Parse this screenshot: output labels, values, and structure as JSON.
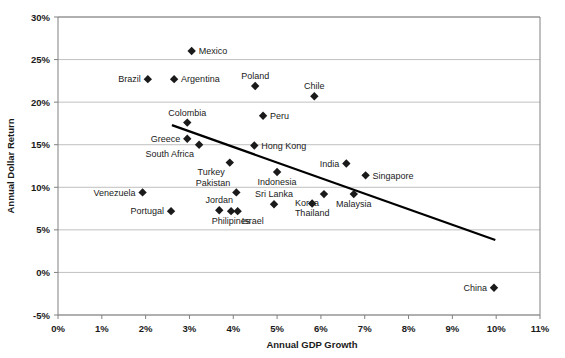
{
  "chart_data": {
    "type": "scatter",
    "title": "",
    "xlabel": "Annual GDP Growth",
    "ylabel": "Annual Dollar Return",
    "xlim": [
      0,
      11
    ],
    "ylim": [
      -5,
      30
    ],
    "xtick_labels": [
      "0%",
      "1%",
      "2%",
      "3%",
      "4%",
      "5%",
      "6%",
      "7%",
      "8%",
      "9%",
      "10%",
      "11%"
    ],
    "xticks": [
      0,
      1,
      2,
      3,
      4,
      5,
      6,
      7,
      8,
      9,
      10,
      11
    ],
    "ytick_labels": [
      "-5%",
      "0%",
      "5%",
      "10%",
      "15%",
      "20%",
      "25%",
      "30%"
    ],
    "yticks": [
      -5,
      0,
      5,
      10,
      15,
      20,
      25,
      30
    ],
    "grid": "horizontal",
    "legend": "none",
    "units": "percent",
    "marker_shape": "diamond",
    "marker_color": "#1a1a1a",
    "points": [
      {
        "name": "Mexico",
        "x": 3.05,
        "y": 26.0,
        "label_pos": "right"
      },
      {
        "name": "Brazil",
        "x": 2.05,
        "y": 22.7,
        "label_pos": "left"
      },
      {
        "name": "Argentina",
        "x": 2.65,
        "y": 22.7,
        "label_pos": "right"
      },
      {
        "name": "Poland",
        "x": 4.5,
        "y": 21.9,
        "label_pos": "above"
      },
      {
        "name": "Chile",
        "x": 5.85,
        "y": 20.7,
        "label_pos": "above"
      },
      {
        "name": "Peru",
        "x": 4.68,
        "y": 18.4,
        "label_pos": "right"
      },
      {
        "name": "Colombia",
        "x": 2.95,
        "y": 17.6,
        "label_pos": "above"
      },
      {
        "name": "Greece",
        "x": 2.95,
        "y": 15.7,
        "label_pos": "left"
      },
      {
        "name": "South Africa",
        "x": 3.22,
        "y": 15.0,
        "label_pos": "belowleft"
      },
      {
        "name": "Hong Kong",
        "x": 4.48,
        "y": 14.9,
        "label_pos": "right"
      },
      {
        "name": "Turkey",
        "x": 3.92,
        "y": 12.9,
        "label_pos": "belowleft"
      },
      {
        "name": "India",
        "x": 6.58,
        "y": 12.8,
        "label_pos": "left"
      },
      {
        "name": "Indonesia",
        "x": 5.0,
        "y": 11.8,
        "label_pos": "below"
      },
      {
        "name": "Singapore",
        "x": 7.02,
        "y": 11.4,
        "label_pos": "right"
      },
      {
        "name": "Venezuela",
        "x": 1.93,
        "y": 9.4,
        "label_pos": "left"
      },
      {
        "name": "Pakistan",
        "x": 4.07,
        "y": 9.4,
        "label_pos": "aboveleft"
      },
      {
        "name": "Korea",
        "x": 6.07,
        "y": 9.2,
        "label_pos": "belowleft"
      },
      {
        "name": "Malaysia",
        "x": 6.75,
        "y": 9.2,
        "label_pos": "below"
      },
      {
        "name": "Sri Lanka",
        "x": 4.93,
        "y": 8.0,
        "label_pos": "above"
      },
      {
        "name": "Thailand",
        "x": 5.8,
        "y": 8.1,
        "label_pos": "below"
      },
      {
        "name": "Jordan",
        "x": 3.68,
        "y": 7.3,
        "label_pos": "above"
      },
      {
        "name": "Portugal",
        "x": 2.58,
        "y": 7.2,
        "label_pos": "left"
      },
      {
        "name": "Philipines",
        "x": 3.95,
        "y": 7.2,
        "label_pos": "below"
      },
      {
        "name": "Israel",
        "x": 4.1,
        "y": 7.2,
        "label_pos": "belowright"
      },
      {
        "name": "China",
        "x": 9.95,
        "y": -1.8,
        "label_pos": "left"
      }
    ],
    "trendline": {
      "label": "linear-trend",
      "x_start": 2.6,
      "y_start": 17.3,
      "x_end": 9.98,
      "y_end": 3.8
    }
  }
}
